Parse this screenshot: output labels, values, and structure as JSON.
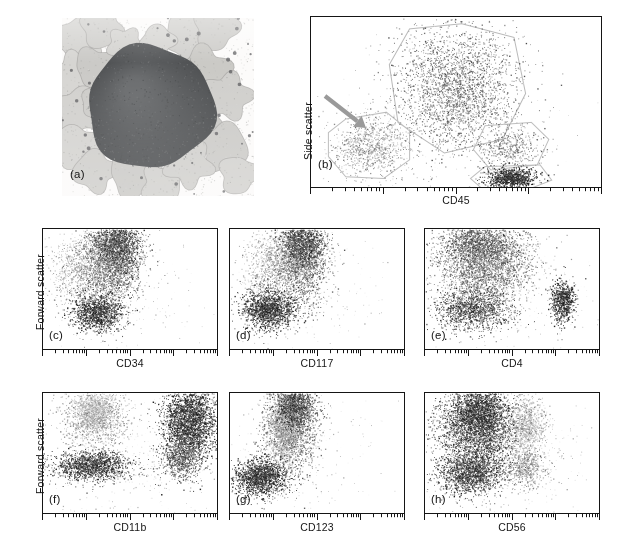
{
  "figure": {
    "kind": "flow-cytometry-immunophenotyping-figure",
    "background": "#ffffff",
    "ink": "#151515"
  },
  "panels": {
    "a": {
      "tag": "(a)",
      "type": "micrograph",
      "description": "Wright-Giemsa stained marrow smear with a large dark blast cell surrounded by pale cells",
      "frame": {
        "x": 62,
        "y": 18,
        "w": 192,
        "h": 178
      },
      "tag_pos": {
        "x": 70,
        "y": 168
      }
    },
    "b": {
      "tag": "(b)",
      "type": "scatter",
      "xlabel": "CD45",
      "ylabel": "Side scatter",
      "frame": {
        "x": 310,
        "y": 16,
        "w": 292,
        "h": 172
      },
      "tag_pos": {
        "x": 318,
        "y": 158
      },
      "xlabel_pos": {
        "x": 310,
        "y": 194,
        "w": 292
      },
      "ylabel_pos": {
        "x": 302,
        "y": 160
      },
      "arrow": {
        "x1": 325,
        "y1": 96,
        "x2": 366,
        "y2": 128,
        "color": "#9a9a9a",
        "width": 4.2
      }
    },
    "c": {
      "tag": "(c)",
      "type": "scatter",
      "xlabel": "CD34",
      "ylabel": "Forward scatter",
      "frame": {
        "x": 42,
        "y": 228,
        "w": 176,
        "h": 122
      },
      "tag_pos": {
        "x": 49,
        "y": 329
      },
      "xlabel_pos": {
        "x": 42,
        "y": 357,
        "w": 176
      },
      "ylabel_pos": {
        "x": 34,
        "y": 330
      }
    },
    "d": {
      "tag": "(d)",
      "type": "scatter",
      "xlabel": "CD117",
      "frame": {
        "x": 229,
        "y": 228,
        "w": 176,
        "h": 122
      },
      "tag_pos": {
        "x": 236,
        "y": 329
      },
      "xlabel_pos": {
        "x": 229,
        "y": 357,
        "w": 176
      }
    },
    "e": {
      "tag": "(e)",
      "type": "scatter",
      "xlabel": "CD4",
      "frame": {
        "x": 424,
        "y": 228,
        "w": 176,
        "h": 122
      },
      "tag_pos": {
        "x": 431,
        "y": 329
      },
      "xlabel_pos": {
        "x": 424,
        "y": 357,
        "w": 176
      }
    },
    "f": {
      "tag": "(f)",
      "type": "scatter",
      "xlabel": "CD11b",
      "ylabel": "Forward scatter",
      "frame": {
        "x": 42,
        "y": 392,
        "w": 176,
        "h": 122
      },
      "tag_pos": {
        "x": 49,
        "y": 493
      },
      "xlabel_pos": {
        "x": 42,
        "y": 521,
        "w": 176
      },
      "ylabel_pos": {
        "x": 34,
        "y": 494
      }
    },
    "g": {
      "tag": "(g)",
      "type": "scatter",
      "xlabel": "CD123",
      "frame": {
        "x": 229,
        "y": 392,
        "w": 176,
        "h": 122
      },
      "tag_pos": {
        "x": 236,
        "y": 493
      },
      "xlabel_pos": {
        "x": 229,
        "y": 521,
        "w": 176
      }
    },
    "h": {
      "tag": "(h)",
      "type": "scatter",
      "xlabel": "CD56",
      "frame": {
        "x": 424,
        "y": 392,
        "w": 176,
        "h": 122
      },
      "tag_pos": {
        "x": 431,
        "y": 493
      },
      "xlabel_pos": {
        "x": 424,
        "y": 521,
        "w": 176
      }
    }
  },
  "axis": {
    "scale": "log",
    "decades": 4,
    "minor_per_decade": [
      2,
      3,
      4,
      5,
      6,
      7,
      8,
      9
    ],
    "major_tick_len": 6,
    "minor_tick_len": 3.2,
    "tick_color": "#151515",
    "tick_width": 1
  },
  "chart_data": {
    "type": "scatter",
    "note": "Flow cytometry dot plots. Each population is a 2-D cloud in normalized panel coordinates (0-1, x left-to-right, y bottom-to-top on a 4-decade log x axis).",
    "plots": [
      {
        "id": "b",
        "title": "(b) CD45 vs Side scatter",
        "xlabel": "CD45",
        "ylabel": "Side scatter",
        "seed": 1207,
        "gates": [
          {
            "name": "granulocyte-gate",
            "color": "#b9b9b9",
            "points": [
              [
                0.34,
                0.93
              ],
              [
                0.52,
                0.96
              ],
              [
                0.7,
                0.88
              ],
              [
                0.74,
                0.55
              ],
              [
                0.66,
                0.28
              ],
              [
                0.46,
                0.2
              ],
              [
                0.3,
                0.38
              ],
              [
                0.27,
                0.72
              ]
            ]
          },
          {
            "name": "blast-gate",
            "color": "#bdbdbd",
            "points": [
              [
                0.12,
                0.4
              ],
              [
                0.26,
                0.44
              ],
              [
                0.34,
                0.33
              ],
              [
                0.34,
                0.16
              ],
              [
                0.25,
                0.05
              ],
              [
                0.12,
                0.06
              ],
              [
                0.06,
                0.18
              ],
              [
                0.06,
                0.32
              ]
            ]
          },
          {
            "name": "monocyte-gate",
            "color": "#bdbdbd",
            "points": [
              [
                0.6,
                0.36
              ],
              [
                0.76,
                0.38
              ],
              [
                0.82,
                0.28
              ],
              [
                0.78,
                0.13
              ],
              [
                0.62,
                0.1
              ],
              [
                0.56,
                0.22
              ]
            ]
          },
          {
            "name": "lymphocyte-gate",
            "color": "#bdbdbd",
            "points": [
              [
                0.6,
                0.12
              ],
              [
                0.79,
                0.13
              ],
              [
                0.83,
                0.04
              ],
              [
                0.74,
                -0.02
              ],
              [
                0.59,
                -0.01
              ],
              [
                0.55,
                0.05
              ]
            ]
          }
        ],
        "clouds": [
          {
            "name": "granulocytes",
            "n": 2600,
            "cx": 0.5,
            "cy": 0.58,
            "sx": 0.105,
            "sy": 0.185,
            "shade": 0.6,
            "size": 1.0
          },
          {
            "name": "blasts",
            "n": 900,
            "cx": 0.2,
            "cy": 0.24,
            "sx": 0.062,
            "sy": 0.088,
            "shade": 0.42,
            "size": 1.0
          },
          {
            "name": "monocytes",
            "n": 420,
            "cx": 0.69,
            "cy": 0.23,
            "sx": 0.05,
            "sy": 0.06,
            "shade": 0.52,
            "size": 1.0
          },
          {
            "name": "lymphocytes",
            "n": 900,
            "cx": 0.69,
            "cy": 0.055,
            "sx": 0.042,
            "sy": 0.03,
            "shade": 0.92,
            "size": 1.05
          },
          {
            "name": "debris",
            "n": 140,
            "cx": 0.45,
            "cy": 0.35,
            "sx": 0.26,
            "sy": 0.26,
            "shade": 0.25,
            "size": 0.9
          }
        ]
      },
      {
        "id": "c",
        "title": "(c) CD34 vs Forward scatter",
        "xlabel": "CD34",
        "seed": 3311,
        "clouds": [
          {
            "name": "cd34-positive-blasts",
            "n": 2100,
            "cx": 0.4,
            "cy": 0.74,
            "sx": 0.085,
            "sy": 0.18,
            "shade": 0.62,
            "size": 1.0
          },
          {
            "name": "upper-dense-core",
            "n": 1100,
            "cx": 0.42,
            "cy": 0.88,
            "sx": 0.065,
            "sy": 0.11,
            "shade": 0.8,
            "size": 1.0
          },
          {
            "name": "negative-left-smear",
            "n": 900,
            "cx": 0.22,
            "cy": 0.66,
            "sx": 0.09,
            "sy": 0.16,
            "shade": 0.4,
            "size": 0.95
          },
          {
            "name": "lower-dark-cluster",
            "n": 1250,
            "cx": 0.31,
            "cy": 0.3,
            "sx": 0.07,
            "sy": 0.08,
            "shade": 0.88,
            "size": 1.0
          },
          {
            "name": "sparse-background",
            "n": 300,
            "cx": 0.42,
            "cy": 0.5,
            "sx": 0.24,
            "sy": 0.28,
            "shade": 0.22,
            "size": 0.9
          }
        ]
      },
      {
        "id": "d",
        "title": "(d) CD117 vs Forward scatter",
        "xlabel": "CD117",
        "seed": 4422,
        "clouds": [
          {
            "name": "cd117-positive-blasts",
            "n": 2000,
            "cx": 0.4,
            "cy": 0.74,
            "sx": 0.08,
            "sy": 0.185,
            "shade": 0.62,
            "size": 1.0
          },
          {
            "name": "upper-dense-core",
            "n": 1000,
            "cx": 0.41,
            "cy": 0.9,
            "sx": 0.06,
            "sy": 0.1,
            "shade": 0.82,
            "size": 1.0
          },
          {
            "name": "negative-left-smear",
            "n": 800,
            "cx": 0.24,
            "cy": 0.68,
            "sx": 0.085,
            "sy": 0.16,
            "shade": 0.38,
            "size": 0.95
          },
          {
            "name": "lower-dark-cluster",
            "n": 1500,
            "cx": 0.22,
            "cy": 0.33,
            "sx": 0.075,
            "sy": 0.08,
            "shade": 0.9,
            "size": 1.0
          },
          {
            "name": "sparse-background",
            "n": 280,
            "cx": 0.4,
            "cy": 0.5,
            "sx": 0.22,
            "sy": 0.28,
            "shade": 0.22,
            "size": 0.9
          }
        ]
      },
      {
        "id": "e",
        "title": "(e) CD4 vs Forward scatter",
        "xlabel": "CD4",
        "seed": 5533,
        "clouds": [
          {
            "name": "cd4-dim-blasts",
            "n": 2600,
            "cx": 0.34,
            "cy": 0.72,
            "sx": 0.135,
            "sy": 0.175,
            "shade": 0.58,
            "size": 1.0
          },
          {
            "name": "upper-dense-core",
            "n": 1000,
            "cx": 0.3,
            "cy": 0.88,
            "sx": 0.1,
            "sy": 0.095,
            "shade": 0.72,
            "size": 1.0
          },
          {
            "name": "lower-left-cluster",
            "n": 1300,
            "cx": 0.27,
            "cy": 0.33,
            "sx": 0.105,
            "sy": 0.085,
            "shade": 0.8,
            "size": 1.0
          },
          {
            "name": "cd4-bright-cluster",
            "n": 700,
            "cx": 0.79,
            "cy": 0.4,
            "sx": 0.034,
            "sy": 0.085,
            "shade": 0.92,
            "size": 1.05
          },
          {
            "name": "sparse-background",
            "n": 420,
            "cx": 0.45,
            "cy": 0.5,
            "sx": 0.26,
            "sy": 0.3,
            "shade": 0.24,
            "size": 0.9
          }
        ]
      },
      {
        "id": "f",
        "title": "(f) CD11b vs Forward scatter",
        "xlabel": "CD11b",
        "seed": 6644,
        "clouds": [
          {
            "name": "cd11b-negative-blasts",
            "n": 1300,
            "cx": 0.3,
            "cy": 0.8,
            "sx": 0.09,
            "sy": 0.12,
            "shade": 0.4,
            "size": 0.95
          },
          {
            "name": "pale-upper-core",
            "n": 600,
            "cx": 0.29,
            "cy": 0.86,
            "sx": 0.055,
            "sy": 0.07,
            "shade": 0.3,
            "size": 1.0
          },
          {
            "name": "lower-dark-band",
            "n": 1500,
            "cx": 0.28,
            "cy": 0.4,
            "sx": 0.11,
            "sy": 0.06,
            "shade": 0.86,
            "size": 1.0
          },
          {
            "name": "cd11b-bright-maturing",
            "n": 2600,
            "cx": 0.84,
            "cy": 0.76,
            "sx": 0.075,
            "sy": 0.165,
            "shade": 0.88,
            "size": 1.05
          },
          {
            "name": "cd11b-bright-tail",
            "n": 700,
            "cx": 0.79,
            "cy": 0.45,
            "sx": 0.06,
            "sy": 0.09,
            "shade": 0.7,
            "size": 1.0
          },
          {
            "name": "sparse-background",
            "n": 450,
            "cx": 0.5,
            "cy": 0.5,
            "sx": 0.26,
            "sy": 0.3,
            "shade": 0.24,
            "size": 0.9
          }
        ]
      },
      {
        "id": "g",
        "title": "(g) CD123 vs Forward scatter",
        "xlabel": "CD123",
        "seed": 7755,
        "clouds": [
          {
            "name": "cd123-positive-blasts",
            "n": 2100,
            "cx": 0.35,
            "cy": 0.74,
            "sx": 0.07,
            "sy": 0.18,
            "shade": 0.6,
            "size": 1.0
          },
          {
            "name": "pale-core",
            "n": 900,
            "cx": 0.3,
            "cy": 0.72,
            "sx": 0.045,
            "sy": 0.14,
            "shade": 0.36,
            "size": 1.0
          },
          {
            "name": "upper-dark-core",
            "n": 900,
            "cx": 0.37,
            "cy": 0.9,
            "sx": 0.055,
            "sy": 0.09,
            "shade": 0.82,
            "size": 1.0
          },
          {
            "name": "lower-dark-cluster",
            "n": 1600,
            "cx": 0.18,
            "cy": 0.3,
            "sx": 0.075,
            "sy": 0.075,
            "shade": 0.9,
            "size": 1.0
          },
          {
            "name": "sparse-background",
            "n": 320,
            "cx": 0.38,
            "cy": 0.48,
            "sx": 0.22,
            "sy": 0.3,
            "shade": 0.22,
            "size": 0.9
          }
        ]
      },
      {
        "id": "h",
        "title": "(h) CD56 vs Forward scatter",
        "xlabel": "CD56",
        "seed": 8866,
        "clouds": [
          {
            "name": "cd56-negative-blasts",
            "n": 3000,
            "cx": 0.3,
            "cy": 0.7,
            "sx": 0.115,
            "sy": 0.19,
            "shade": 0.8,
            "size": 1.0
          },
          {
            "name": "upper-dark-core",
            "n": 1200,
            "cx": 0.31,
            "cy": 0.84,
            "sx": 0.08,
            "sy": 0.11,
            "shade": 0.9,
            "size": 1.0
          },
          {
            "name": "lower-dark-cluster",
            "n": 1400,
            "cx": 0.26,
            "cy": 0.33,
            "sx": 0.095,
            "sy": 0.085,
            "shade": 0.84,
            "size": 1.0
          },
          {
            "name": "cd56-dim-pale-cluster",
            "n": 900,
            "cx": 0.58,
            "cy": 0.72,
            "sx": 0.055,
            "sy": 0.135,
            "shade": 0.34,
            "size": 1.0
          },
          {
            "name": "cd56-dim-lower",
            "n": 500,
            "cx": 0.57,
            "cy": 0.38,
            "sx": 0.06,
            "sy": 0.08,
            "shade": 0.5,
            "size": 0.95
          },
          {
            "name": "sparse-background",
            "n": 520,
            "cx": 0.45,
            "cy": 0.5,
            "sx": 0.26,
            "sy": 0.3,
            "shade": 0.26,
            "size": 0.9
          }
        ]
      }
    ]
  },
  "micrograph_cells": {
    "background": "#fcfbfa",
    "blast": {
      "cx": 0.46,
      "cy": 0.5,
      "r": 0.245,
      "shade": "#585a5c"
    },
    "pale_cells": [
      {
        "cx": 0.1,
        "cy": 0.12,
        "r": 0.105,
        "shade": "#d3d2cf"
      },
      {
        "cx": 0.21,
        "cy": 0.06,
        "r": 0.085,
        "shade": "#cfcecb"
      },
      {
        "cx": 0.07,
        "cy": 0.32,
        "r": 0.095,
        "shade": "#d6d5d2"
      },
      {
        "cx": 0.17,
        "cy": 0.27,
        "r": 0.08,
        "shade": "#cbcac7"
      },
      {
        "cx": 0.09,
        "cy": 0.52,
        "r": 0.1,
        "shade": "#d2d1ce"
      },
      {
        "cx": 0.2,
        "cy": 0.47,
        "r": 0.078,
        "shade": "#cdccc9"
      },
      {
        "cx": 0.08,
        "cy": 0.72,
        "r": 0.092,
        "shade": "#d5d4d1"
      },
      {
        "cx": 0.17,
        "cy": 0.86,
        "r": 0.088,
        "shade": "#d0cfcc"
      },
      {
        "cx": 0.33,
        "cy": 0.15,
        "r": 0.072,
        "shade": "#d4d3d0"
      },
      {
        "cx": 0.38,
        "cy": 0.87,
        "r": 0.105,
        "shade": "#cccbc8"
      },
      {
        "cx": 0.52,
        "cy": 0.93,
        "r": 0.082,
        "shade": "#d3d2cf"
      },
      {
        "cx": 0.66,
        "cy": 0.1,
        "r": 0.1,
        "shade": "#d1d0cd"
      },
      {
        "cx": 0.8,
        "cy": 0.06,
        "r": 0.09,
        "shade": "#cecdca"
      },
      {
        "cx": 0.74,
        "cy": 0.3,
        "r": 0.105,
        "shade": "#cbcac6"
      },
      {
        "cx": 0.86,
        "cy": 0.44,
        "r": 0.098,
        "shade": "#d0cfcc"
      },
      {
        "cx": 0.72,
        "cy": 0.58,
        "r": 0.092,
        "shade": "#c9c8c5"
      },
      {
        "cx": 0.84,
        "cy": 0.72,
        "r": 0.1,
        "shade": "#cdccc9"
      },
      {
        "cx": 0.66,
        "cy": 0.82,
        "r": 0.095,
        "shade": "#d2d1ce"
      },
      {
        "cx": 0.92,
        "cy": 0.88,
        "r": 0.08,
        "shade": "#d4d3d0"
      },
      {
        "cx": 0.5,
        "cy": 0.13,
        "r": 0.07,
        "shade": "#d6d5d2"
      }
    ]
  }
}
